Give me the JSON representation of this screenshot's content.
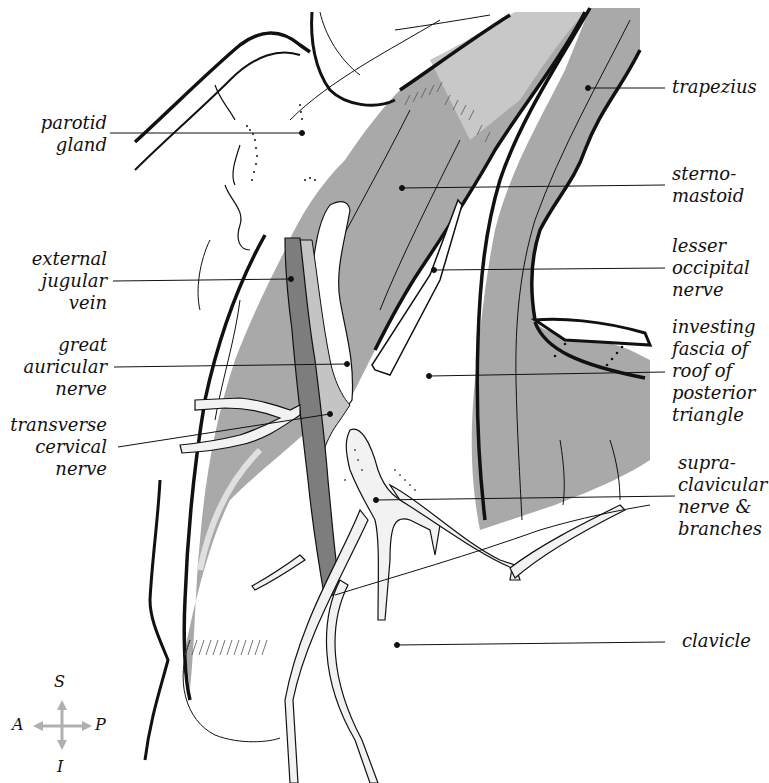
{
  "figure": {
    "colors": {
      "muscle_gray": "#a9a9a9",
      "muscle_light": "#c8c8c8",
      "vein_dark": "#7d7d7d",
      "outline": "#111111",
      "nerve_fill": "#f2f2f2",
      "background": "#ffffff",
      "compass": "#b0b0b0"
    }
  },
  "labels": {
    "left": [
      {
        "id": "parotid-gland",
        "text": "parotid\ngland"
      },
      {
        "id": "external-jugular-vein",
        "text": "external\njugular\nvein"
      },
      {
        "id": "great-auricular-nerve",
        "text": "great\nauricular\nnerve"
      },
      {
        "id": "transverse-cervical-nerve",
        "text": "transverse\ncervical\nnerve"
      }
    ],
    "right": [
      {
        "id": "trapezius",
        "text": "trapezius"
      },
      {
        "id": "sternomastoid",
        "text": "sterno-\nmastoid"
      },
      {
        "id": "lesser-occipital-nerve",
        "text": "lesser\noccipital\nnerve"
      },
      {
        "id": "investing-fascia",
        "text": "investing\nfascia of\nroof of\nposterior\ntriangle"
      },
      {
        "id": "supraclavicular-nerve",
        "text": "supra-\nclavicular\nnerve &\nbranches"
      },
      {
        "id": "clavicle",
        "text": "clavicle"
      }
    ]
  },
  "compass": {
    "superior": "S",
    "inferior": "I",
    "anterior": "A",
    "posterior": "P"
  }
}
